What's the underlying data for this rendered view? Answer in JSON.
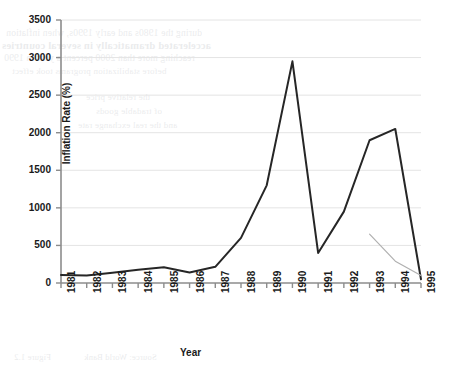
{
  "chart_data": {
    "type": "line",
    "title": "",
    "xlabel": "Year",
    "ylabel": "Inflation Rate (%)",
    "categories": [
      "1981",
      "1982",
      "1983",
      "1984",
      "1985",
      "1986",
      "1987",
      "1988",
      "1989",
      "1990",
      "1991",
      "1992",
      "1993",
      "1994",
      "1995"
    ],
    "ylim": [
      0,
      3500
    ],
    "yticks": [
      "0",
      "500",
      "1000",
      "1500",
      "2000",
      "2500",
      "3000",
      "3500"
    ],
    "ytick_values": [
      0,
      500,
      1000,
      1500,
      2000,
      2500,
      3000,
      3500
    ],
    "grid": "horizontal",
    "legend": "none",
    "series": [
      {
        "name": "inflation-rate-main",
        "color": "#262626",
        "width": 2.0,
        "x": [
          "1981",
          "1982",
          "1983",
          "1984",
          "1985",
          "1986",
          "1987",
          "1988",
          "1989",
          "1990",
          "1991",
          "1992",
          "1993",
          "1994",
          "1995"
        ],
        "values": [
          105,
          100,
          135,
          175,
          210,
          140,
          215,
          600,
          1300,
          2950,
          400,
          950,
          1900,
          2050,
          50
        ]
      },
      {
        "name": "inflation-rate-secondary",
        "color": "#b0b0b0",
        "width": 1.2,
        "x": [
          "1993",
          "1994",
          "1995"
        ],
        "values": [
          650,
          290,
          100
        ]
      }
    ]
  },
  "background_bleed": {
    "line1": "during the 1980s and early 1990s, when inflation",
    "line2": "accelerated dramatically in several countries",
    "line3": "reaching more than 2000 percent a year in 1990",
    "line4": "before stabilization programs took effect",
    "line5": "the relative price",
    "line6": "of tradable goods",
    "line7": "and the real exchange rate",
    "line8": "Figure 1.2",
    "line9": "Source: World Bank"
  }
}
